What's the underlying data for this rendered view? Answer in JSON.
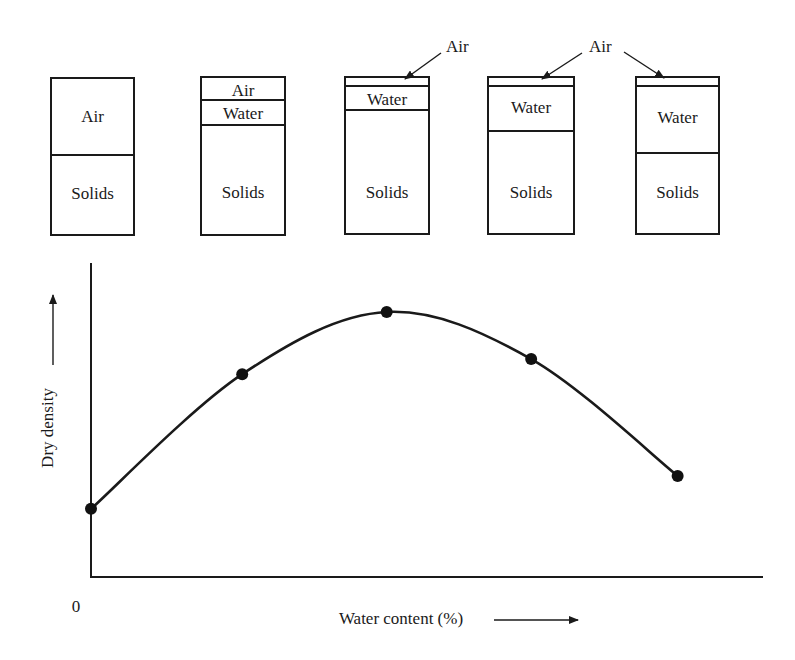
{
  "phase_diagrams": {
    "boxes": [
      {
        "id": "sample-1",
        "layers": [
          {
            "name": "Air",
            "label": "Air"
          },
          {
            "name": "Solids",
            "label": "Solids"
          }
        ]
      },
      {
        "id": "sample-2",
        "layers": [
          {
            "name": "Air",
            "label": "Air"
          },
          {
            "name": "Water",
            "label": "Water"
          },
          {
            "name": "Solids",
            "label": "Solids"
          }
        ]
      },
      {
        "id": "sample-3",
        "layers": [
          {
            "name": "Air",
            "label": ""
          },
          {
            "name": "Water",
            "label": "Water"
          },
          {
            "name": "Solids",
            "label": "Solids"
          }
        ]
      },
      {
        "id": "sample-4",
        "layers": [
          {
            "name": "Air",
            "label": ""
          },
          {
            "name": "Water",
            "label": "Water"
          },
          {
            "name": "Solids",
            "label": "Solids"
          }
        ]
      },
      {
        "id": "sample-5",
        "layers": [
          {
            "name": "Air",
            "label": ""
          },
          {
            "name": "Water",
            "label": "Water"
          },
          {
            "name": "Solids",
            "label": "Solids"
          }
        ]
      }
    ],
    "callouts": [
      {
        "label": "Air",
        "points_to": [
          "sample-3"
        ]
      },
      {
        "label": "Air",
        "points_to": [
          "sample-4",
          "sample-5"
        ]
      }
    ]
  },
  "chart_data": {
    "type": "line",
    "title": "",
    "xlabel": "Water content (%)",
    "ylabel": "Dry density",
    "origin_label": "0",
    "x_ticks": [],
    "y_ticks": [],
    "xlim": [
      0,
      100
    ],
    "ylim": [
      0,
      100
    ],
    "grid": false,
    "legend": "none",
    "smooth": true,
    "series": [
      {
        "name": "Compaction curve",
        "x": [
          0,
          22.5,
          44,
          65.5,
          87.3
        ],
        "y": [
          21.7,
          64.6,
          84.4,
          69.4,
          32.2
        ]
      }
    ]
  }
}
